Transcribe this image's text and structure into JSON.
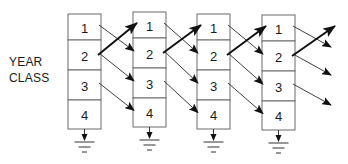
{
  "label": {
    "line1": "YEAR",
    "line2": "CLASS"
  },
  "columns": [
    {
      "x": 68,
      "top": 14,
      "cells": [
        {
          "n": "1",
          "y2": 40
        },
        {
          "n": "2",
          "y2": 70
        },
        {
          "n": "3",
          "y2": 100
        },
        {
          "n": "4",
          "y2": 129
        }
      ]
    },
    {
      "x": 133,
      "top": 12,
      "cells": [
        {
          "n": "1",
          "y2": 38
        },
        {
          "n": "2",
          "y2": 68
        },
        {
          "n": "3",
          "y2": 98
        },
        {
          "n": "4",
          "y2": 127
        }
      ]
    },
    {
      "x": 197,
      "top": 14,
      "cells": [
        {
          "n": "1",
          "y2": 40
        },
        {
          "n": "2",
          "y2": 70
        },
        {
          "n": "3",
          "y2": 100
        },
        {
          "n": "4",
          "y2": 129
        }
      ]
    },
    {
      "x": 262,
      "top": 15,
      "cells": [
        {
          "n": "1",
          "y2": 41
        },
        {
          "n": "2",
          "y2": 71
        },
        {
          "n": "3",
          "y2": 101
        },
        {
          "n": "4",
          "y2": 130
        }
      ]
    }
  ],
  "box_width": 33,
  "transitions": {
    "aging": [
      {
        "from": "1",
        "to": "2",
        "desc": "survival/aging"
      },
      {
        "from": "2",
        "to": "3",
        "desc": "survival/aging"
      },
      {
        "from": "3",
        "to": "4",
        "desc": "survival/aging"
      }
    ],
    "recruitment": {
      "from": "2",
      "to": "1",
      "desc": "reproduction"
    },
    "mortality": {
      "from": "4",
      "to": "ground",
      "desc": "death/exit"
    }
  },
  "colors": {
    "box_stroke": "#6a6a6a",
    "arrow": "#111111",
    "text": "#1a1a1a"
  }
}
